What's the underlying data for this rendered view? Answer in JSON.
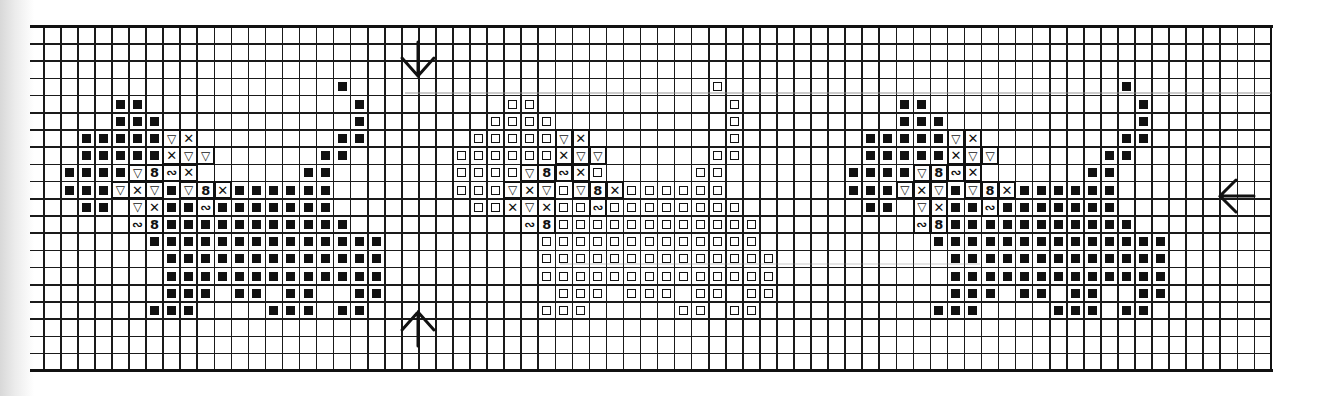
{
  "chart_title": "",
  "grid": {
    "columns": 72,
    "rows": 20,
    "origin_x": 43,
    "origin_y": 26,
    "cell_w": 17.05,
    "cell_h": 17.2,
    "partial_left_column_x": 30,
    "line_color": "#1a1a1a"
  },
  "legend_symbols": {
    "F": {
      "name": "filled-square",
      "glyph": "■"
    },
    "O": {
      "name": "open-square",
      "glyph": "□"
    },
    "V": {
      "name": "triangle-down",
      "glyph": "▽"
    },
    "X": {
      "name": "cross",
      "glyph": "✕"
    },
    "8": {
      "name": "figure-eight",
      "glyph": "8"
    },
    "N": {
      "name": "wave",
      "glyph": "∾"
    }
  },
  "center_markers": {
    "top_arrow": {
      "direction": "down",
      "glyph": "↓",
      "grid_line_col": 22
    },
    "bottom_arrow": {
      "direction": "up",
      "glyph": "↑",
      "grid_line_col": 22
    },
    "right_arrow": {
      "direction": "left",
      "glyph": "←",
      "grid_line_row": 10
    }
  },
  "motifs": [
    {
      "name": "cat-1-filled",
      "cells": [
        {
          "r": 3,
          "c": [
            18
          ],
          "s": "F"
        },
        {
          "r": 4,
          "c": [
            5,
            6,
            19
          ],
          "s": "F"
        },
        {
          "r": 5,
          "c": [
            5,
            6,
            7,
            19
          ],
          "s": "F"
        },
        {
          "r": 6,
          "c": [
            3,
            4,
            5,
            6,
            7,
            18,
            19
          ],
          "s": "F"
        },
        {
          "r": 6,
          "c": [
            8
          ],
          "s": "V"
        },
        {
          "r": 6,
          "c": [
            9
          ],
          "s": "X"
        },
        {
          "r": 7,
          "c": [
            3,
            4,
            5,
            6,
            7,
            17,
            18
          ],
          "s": "F"
        },
        {
          "r": 7,
          "c": [
            8
          ],
          "s": "X"
        },
        {
          "r": 7,
          "c": [
            9,
            10
          ],
          "s": "V"
        },
        {
          "r": 8,
          "c": [
            2,
            3,
            4,
            5,
            16,
            17
          ],
          "s": "F"
        },
        {
          "r": 8,
          "c": [
            6
          ],
          "s": "V"
        },
        {
          "r": 8,
          "c": [
            7
          ],
          "s": "8"
        },
        {
          "r": 8,
          "c": [
            8
          ],
          "s": "N"
        },
        {
          "r": 8,
          "c": [
            9
          ],
          "s": "X"
        },
        {
          "r": 9,
          "c": [
            2,
            3,
            4,
            8,
            12,
            13,
            14,
            15,
            16,
            17
          ],
          "s": "F"
        },
        {
          "r": 9,
          "c": [
            5,
            7,
            9
          ],
          "s": "V"
        },
        {
          "r": 9,
          "c": [
            6,
            11
          ],
          "s": "X"
        },
        {
          "r": 9,
          "c": [
            10
          ],
          "s": "8"
        },
        {
          "r": 10,
          "c": [
            3,
            4,
            8,
            9,
            11,
            12,
            13,
            14,
            15,
            16,
            17
          ],
          "s": "F"
        },
        {
          "r": 10,
          "c": [
            6
          ],
          "s": "V"
        },
        {
          "r": 10,
          "c": [
            7
          ],
          "s": "X"
        },
        {
          "r": 10,
          "c": [
            10
          ],
          "s": "N"
        },
        {
          "r": 11,
          "c": [
            8,
            9,
            10,
            11,
            12,
            13,
            14,
            15,
            16,
            17,
            18
          ],
          "s": "F"
        },
        {
          "r": 11,
          "c": [
            6
          ],
          "s": "N"
        },
        {
          "r": 11,
          "c": [
            7
          ],
          "s": "8"
        },
        {
          "r": 12,
          "c": [
            7,
            8,
            9,
            10,
            11,
            12,
            13,
            14,
            15,
            16,
            17,
            18,
            19,
            20
          ],
          "s": "F"
        },
        {
          "r": 13,
          "c": [
            8,
            9,
            10,
            11,
            12,
            13,
            14,
            15,
            16,
            17,
            18,
            19,
            20
          ],
          "s": "F"
        },
        {
          "r": 14,
          "c": [
            8,
            9,
            10,
            11,
            12,
            13,
            14,
            15,
            16,
            17,
            18,
            19,
            20
          ],
          "s": "F"
        },
        {
          "r": 15,
          "c": [
            8,
            9,
            10,
            12,
            13,
            15,
            16,
            19,
            20
          ],
          "s": "F"
        },
        {
          "r": 16,
          "c": [
            7,
            8,
            9,
            14,
            15,
            16,
            18,
            19
          ],
          "s": "F"
        }
      ]
    },
    {
      "name": "cat-2-open",
      "cells": [
        {
          "r": 3,
          "c": [
            40
          ],
          "s": "O"
        },
        {
          "r": 4,
          "c": [
            28,
            29,
            41
          ],
          "s": "O"
        },
        {
          "r": 5,
          "c": [
            27,
            28,
            29,
            30,
            41
          ],
          "s": "O"
        },
        {
          "r": 6,
          "c": [
            26,
            27,
            28,
            29,
            30,
            41
          ],
          "s": "O"
        },
        {
          "r": 6,
          "c": [
            31
          ],
          "s": "V"
        },
        {
          "r": 6,
          "c": [
            32
          ],
          "s": "X"
        },
        {
          "r": 7,
          "c": [
            25,
            26,
            27,
            28,
            29,
            30,
            40,
            41
          ],
          "s": "O"
        },
        {
          "r": 7,
          "c": [
            31
          ],
          "s": "X"
        },
        {
          "r": 7,
          "c": [
            32,
            33
          ],
          "s": "V"
        },
        {
          "r": 8,
          "c": [
            25,
            26,
            27,
            28,
            33,
            39,
            40
          ],
          "s": "O"
        },
        {
          "r": 8,
          "c": [
            29
          ],
          "s": "V"
        },
        {
          "r": 8,
          "c": [
            30
          ],
          "s": "8"
        },
        {
          "r": 8,
          "c": [
            31
          ],
          "s": "N"
        },
        {
          "r": 8,
          "c": [
            32
          ],
          "s": "X"
        },
        {
          "r": 9,
          "c": [
            25,
            26,
            27,
            31,
            35,
            36,
            37,
            38,
            39,
            40
          ],
          "s": "O"
        },
        {
          "r": 9,
          "c": [
            28,
            30,
            32
          ],
          "s": "V"
        },
        {
          "r": 9,
          "c": [
            29,
            34
          ],
          "s": "X"
        },
        {
          "r": 9,
          "c": [
            33
          ],
          "s": "8"
        },
        {
          "r": 10,
          "c": [
            26,
            27,
            31,
            32,
            34,
            35,
            36,
            37,
            38,
            39,
            40,
            41
          ],
          "s": "O"
        },
        {
          "r": 10,
          "c": [
            28,
            30
          ],
          "s": "X"
        },
        {
          "r": 10,
          "c": [
            29
          ],
          "s": "V"
        },
        {
          "r": 10,
          "c": [
            33
          ],
          "s": "N"
        },
        {
          "r": 11,
          "c": [
            31,
            32,
            33,
            34,
            35,
            36,
            37,
            38,
            39,
            40,
            41,
            42
          ],
          "s": "O"
        },
        {
          "r": 11,
          "c": [
            29
          ],
          "s": "N"
        },
        {
          "r": 11,
          "c": [
            30
          ],
          "s": "8"
        },
        {
          "r": 12,
          "c": [
            30,
            31,
            32,
            33,
            34,
            35,
            36,
            37,
            38,
            39,
            40,
            41,
            42
          ],
          "s": "O"
        },
        {
          "r": 13,
          "c": [
            30,
            31,
            32,
            33,
            34,
            35,
            36,
            37,
            38,
            39,
            40,
            41,
            42,
            43
          ],
          "s": "O"
        },
        {
          "r": 14,
          "c": [
            30,
            31,
            32,
            33,
            34,
            35,
            36,
            37,
            38,
            39,
            40,
            41,
            42,
            43
          ],
          "s": "O"
        },
        {
          "r": 15,
          "c": [
            31,
            32,
            33,
            35,
            36,
            37,
            39,
            40,
            42,
            43
          ],
          "s": "O"
        },
        {
          "r": 16,
          "c": [
            30,
            31,
            32,
            38,
            39,
            41,
            42
          ],
          "s": "O"
        }
      ]
    },
    {
      "name": "cat-3-filled",
      "cells": [
        {
          "r": 3,
          "c": [
            64
          ],
          "s": "F"
        },
        {
          "r": 4,
          "c": [
            51,
            52,
            65
          ],
          "s": "F"
        },
        {
          "r": 5,
          "c": [
            51,
            52,
            53,
            65
          ],
          "s": "F"
        },
        {
          "r": 6,
          "c": [
            49,
            50,
            51,
            52,
            53,
            64,
            65
          ],
          "s": "F"
        },
        {
          "r": 6,
          "c": [
            54
          ],
          "s": "V"
        },
        {
          "r": 6,
          "c": [
            55
          ],
          "s": "X"
        },
        {
          "r": 7,
          "c": [
            49,
            50,
            51,
            52,
            53,
            63,
            64
          ],
          "s": "F"
        },
        {
          "r": 7,
          "c": [
            54
          ],
          "s": "X"
        },
        {
          "r": 7,
          "c": [
            55,
            56
          ],
          "s": "V"
        },
        {
          "r": 8,
          "c": [
            48,
            49,
            50,
            51,
            62,
            63
          ],
          "s": "F"
        },
        {
          "r": 8,
          "c": [
            52
          ],
          "s": "V"
        },
        {
          "r": 8,
          "c": [
            53
          ],
          "s": "8"
        },
        {
          "r": 8,
          "c": [
            54
          ],
          "s": "N"
        },
        {
          "r": 8,
          "c": [
            55
          ],
          "s": "X"
        },
        {
          "r": 9,
          "c": [
            48,
            49,
            50,
            54,
            58,
            59,
            60,
            61,
            62,
            63
          ],
          "s": "F"
        },
        {
          "r": 9,
          "c": [
            51,
            53,
            55
          ],
          "s": "V"
        },
        {
          "r": 9,
          "c": [
            52,
            57
          ],
          "s": "X"
        },
        {
          "r": 9,
          "c": [
            56
          ],
          "s": "8"
        },
        {
          "r": 10,
          "c": [
            49,
            50,
            54,
            55,
            57,
            58,
            59,
            60,
            61,
            62,
            63
          ],
          "s": "F"
        },
        {
          "r": 10,
          "c": [
            52
          ],
          "s": "V"
        },
        {
          "r": 10,
          "c": [
            53
          ],
          "s": "X"
        },
        {
          "r": 10,
          "c": [
            56
          ],
          "s": "N"
        },
        {
          "r": 11,
          "c": [
            54,
            55,
            56,
            57,
            58,
            59,
            60,
            61,
            62,
            63,
            64
          ],
          "s": "F"
        },
        {
          "r": 11,
          "c": [
            52
          ],
          "s": "N"
        },
        {
          "r": 11,
          "c": [
            53
          ],
          "s": "8"
        },
        {
          "r": 12,
          "c": [
            53,
            54,
            55,
            56,
            57,
            58,
            59,
            60,
            61,
            62,
            63,
            64,
            65,
            66
          ],
          "s": "F"
        },
        {
          "r": 13,
          "c": [
            54,
            55,
            56,
            57,
            58,
            59,
            60,
            61,
            62,
            63,
            64,
            65,
            66
          ],
          "s": "F"
        },
        {
          "r": 14,
          "c": [
            54,
            55,
            56,
            57,
            58,
            59,
            60,
            61,
            62,
            63,
            64,
            65,
            66
          ],
          "s": "F"
        },
        {
          "r": 15,
          "c": [
            54,
            55,
            56,
            58,
            59,
            61,
            62,
            65,
            66
          ],
          "s": "F"
        },
        {
          "r": 16,
          "c": [
            53,
            54,
            55,
            60,
            61,
            62,
            64,
            65
          ],
          "s": "F"
        }
      ]
    }
  ]
}
